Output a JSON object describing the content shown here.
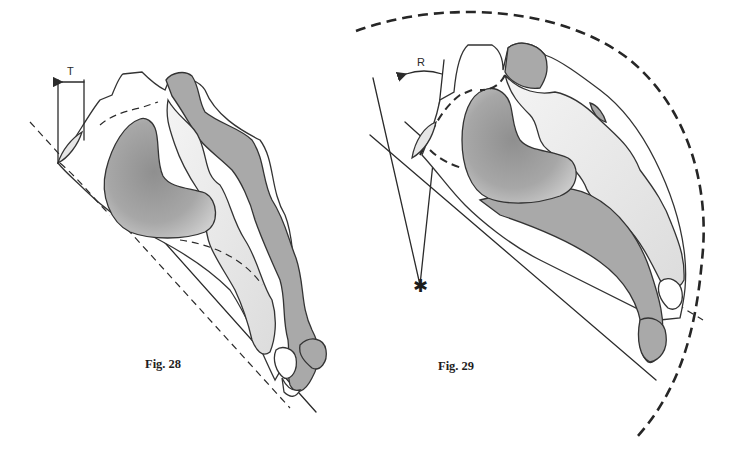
{
  "figures": [
    {
      "id": "fig28",
      "caption": "Fig. 28",
      "annotation_label": "T",
      "annotation_meaning": "arrow indicating translation",
      "elements": [
        "shaded organ outline",
        "dashed reference line",
        "solid tangent line",
        "vertical reference lines with arrow"
      ]
    },
    {
      "id": "fig29",
      "caption": "Fig. 29",
      "annotation_label": "R",
      "annotation_meaning": "curved arrow indicating rotation",
      "center_marker": "✱",
      "elements": [
        "shaded organ outline",
        "large dashed arc",
        "converging lines to rotation center",
        "dashed reference line",
        "solid tangent line"
      ]
    }
  ],
  "colors": {
    "background": "#ffffff",
    "line": "#2b2b2b",
    "dark_fill": "#a9a9a9",
    "mid_fill": "#9a9a9a",
    "light_fill": "#e6e6e6"
  }
}
